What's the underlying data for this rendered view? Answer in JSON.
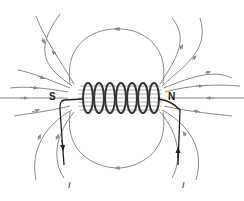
{
  "diagram": {
    "labels": {
      "south_pole": "S",
      "north_pole": "N",
      "current_left": "I",
      "current_right": "I"
    },
    "coil_turns": 7,
    "colors": {
      "field_line": "#8a8a8a",
      "coil": "#333333",
      "wire": "#222222",
      "background": "#ffffff"
    }
  }
}
